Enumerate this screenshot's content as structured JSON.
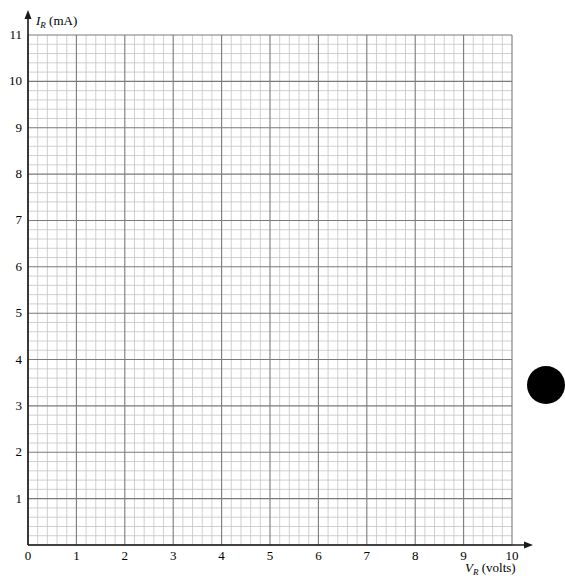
{
  "chart_data": {
    "type": "line",
    "title": "",
    "xlabel": "V_R (volts)",
    "xlabel_main": "V",
    "xlabel_sub": "R",
    "xlabel_unit": " (volts)",
    "ylabel": "I_R (mA)",
    "ylabel_main": "I",
    "ylabel_sub": "R",
    "ylabel_unit": " (mA)",
    "xlim": [
      0,
      10
    ],
    "ylim": [
      0,
      11
    ],
    "x_ticks": [
      "0",
      "1",
      "2",
      "3",
      "4",
      "5",
      "6",
      "7",
      "8",
      "9",
      "10"
    ],
    "y_ticks": [
      "1",
      "2",
      "3",
      "4",
      "5",
      "6",
      "7",
      "8",
      "9",
      "10",
      "11"
    ],
    "minor_divisions_per_unit": 5,
    "grid": true,
    "series": [],
    "legend": null,
    "note": "Blank graph paper for plotting I_R versus V_R"
  },
  "colors": {
    "axis": "#1a1a1a",
    "major_grid": "#7a7a7a",
    "minor_grid": "#c4c4c4",
    "blot": "#000000"
  }
}
